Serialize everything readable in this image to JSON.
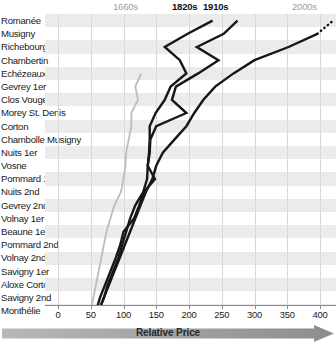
{
  "chart_data": {
    "type": "line",
    "title": "",
    "xlabel": "Relative Price",
    "ylabel": "",
    "orientation": "horizontal-category-axis-vertical",
    "grid": true,
    "legend_position": "top",
    "xlim": [
      0,
      400
    ],
    "xticks": [
      0,
      50,
      100,
      150,
      200,
      250,
      300,
      350,
      400
    ],
    "categories": [
      "Romanée",
      "Musigny",
      "Richebourg",
      "Chambertin",
      "Echézeaux",
      "Gevrey 1er",
      "Clos Vougeot",
      "Morey St. Denis",
      "Corton",
      "Chambolle Musigny",
      "Nuits 1er",
      "Vosne",
      "Pommard 1er",
      "Nuits 2nd",
      "Gevrey 2nd",
      "Volnay 1er",
      "Beaune 1er",
      "Pommard 2nd",
      "Volnay 2nd",
      "Savigny 1er",
      "Aloxe Corton",
      "Savigny 2nd",
      "Monthélie"
    ],
    "series": [
      {
        "name": "1660s",
        "color": "#bdbdbd",
        "style": "solid",
        "values": [
          null,
          null,
          null,
          null,
          127,
          118,
          122,
          112,
          112,
          108,
          104,
          103,
          100,
          96,
          86,
          80,
          74,
          70,
          66,
          62,
          58,
          54,
          50
        ]
      },
      {
        "name": "1820s",
        "color": "#171717",
        "style": "solid",
        "values": [
          236,
          198,
          163,
          186,
          196,
          172,
          163,
          149,
          140,
          140,
          139,
          137,
          136,
          130,
          118,
          110,
          104,
          98,
          92,
          84,
          76,
          70,
          62
        ]
      },
      {
        "name": "1910s",
        "color": "#171717",
        "style": "solid",
        "values": [
          274,
          253,
          212,
          245,
          214,
          180,
          174,
          196,
          150,
          141,
          140,
          137,
          148,
          131,
          124,
          116,
          100,
          95,
          88,
          80,
          72,
          64,
          58
        ]
      },
      {
        "name": "2000s",
        "color": "#171717",
        "style": "solid-with-dotted-extension",
        "values": [
          420,
          396,
          352,
          300,
          268,
          240,
          222,
          208,
          196,
          178,
          160,
          150,
          144,
          134,
          126,
          118,
          110,
          102,
          94,
          86,
          78,
          70,
          62
        ]
      }
    ],
    "annotations": [
      {
        "text": "1660s",
        "x_px": 113,
        "emphasis": "muted"
      },
      {
        "text": "1820s",
        "x_px": 172,
        "emphasis": "strong"
      },
      {
        "text": "1910s",
        "x_px": 203,
        "emphasis": "strong"
      },
      {
        "text": "2000s",
        "x_px": 292,
        "emphasis": "muted"
      }
    ]
  },
  "axis": {
    "label": "Relative Price",
    "ticks": [
      "0",
      "50",
      "100",
      "150",
      "200",
      "250",
      "300",
      "350",
      "400"
    ]
  },
  "colors": {
    "band": "#ebebeb",
    "grid": "#d8d8d8",
    "line_dark": "#171717",
    "line_gray": "#bdbdbd",
    "axis": "#8a8a8a",
    "arrow": "#9a9a9a",
    "text": "#1a1a1a",
    "text_muted": "#9b9b9b"
  }
}
